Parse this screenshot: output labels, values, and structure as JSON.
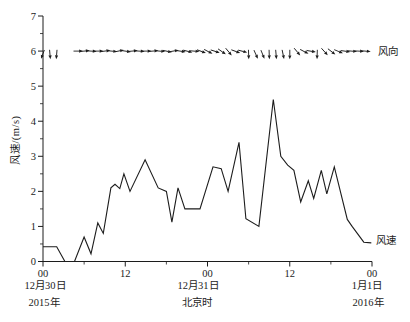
{
  "figure": {
    "width": 410,
    "height": 322,
    "background": "#ffffff",
    "ink_color": "#1c1c1c",
    "labels": {
      "y_axis_title": "风速/(m/s)",
      "x_axis_title": "北京时",
      "series_wind_direction": "风向",
      "series_wind_speed": "风速",
      "date_left_line1": "12月30日",
      "date_left_line2": "2015年",
      "date_mid_line1": "12月31日",
      "date_right_line1": "1月1日",
      "date_right_line2": "2016年"
    }
  },
  "chart_data": {
    "type": "line",
    "title": "",
    "xlabel": "北京时",
    "ylabel": "风速/(m/s)",
    "ylim": [
      0,
      7
    ],
    "xlim_hours": [
      0,
      48
    ],
    "x_axis_span": "2015-12-30 00:00 to 2016-01-01 00:00 Beijing time",
    "grid": false,
    "legend_position": "right-inline",
    "y_major_ticks": [
      0,
      1,
      2,
      3,
      4,
      5,
      6,
      7
    ],
    "y_minor_ticks": [
      0.5,
      1.5,
      2.5,
      3.5,
      4.5,
      5.5,
      6.5
    ],
    "x_major_ticks": [
      {
        "h": 0,
        "label": "00"
      },
      {
        "h": 12,
        "label": "12"
      },
      {
        "h": 24,
        "label": "00"
      },
      {
        "h": 36,
        "label": "12"
      },
      {
        "h": 48,
        "label": "00"
      }
    ],
    "x_minor_ticks_hours": [
      6,
      18,
      30,
      42
    ],
    "series": [
      {
        "name": "风速",
        "type": "line",
        "units": "m/s",
        "points": [
          [
            0,
            0.42
          ],
          [
            2,
            0.42
          ],
          [
            3.2,
            0
          ],
          [
            4.6,
            0
          ],
          [
            6,
            0.7
          ],
          [
            7,
            0.22
          ],
          [
            8,
            1.1
          ],
          [
            8.8,
            0.8
          ],
          [
            9.9,
            2.1
          ],
          [
            10.5,
            2.2
          ],
          [
            11.2,
            2.08
          ],
          [
            11.8,
            2.5
          ],
          [
            12.7,
            2.0
          ],
          [
            14.9,
            2.9
          ],
          [
            16.8,
            2.1
          ],
          [
            18,
            2.0
          ],
          [
            18.8,
            1.12
          ],
          [
            19.7,
            2.1
          ],
          [
            20.7,
            1.5
          ],
          [
            22.9,
            1.5
          ],
          [
            24.8,
            2.7
          ],
          [
            26,
            2.65
          ],
          [
            27,
            2.0
          ],
          [
            28.6,
            3.4
          ],
          [
            29.6,
            1.22
          ],
          [
            31.5,
            1.0
          ],
          [
            33.6,
            4.62
          ],
          [
            34.7,
            3.0
          ],
          [
            35.7,
            2.75
          ],
          [
            36.6,
            2.6
          ],
          [
            37.6,
            1.7
          ],
          [
            38.7,
            2.3
          ],
          [
            39.5,
            1.8
          ],
          [
            40.6,
            2.6
          ],
          [
            41.4,
            1.93
          ],
          [
            42.5,
            2.7
          ],
          [
            44.4,
            1.2
          ],
          [
            45.1,
            1.0
          ],
          [
            46.8,
            0.55
          ],
          [
            47.9,
            0.53
          ]
        ]
      },
      {
        "name": "风向",
        "type": "direction-arrows",
        "baseline_value": 6,
        "angle_convention": "degrees clockwise from east (screen right)",
        "arrows": [
          {
            "h": 0,
            "deg": 110
          },
          {
            "h": 1,
            "deg": 85
          },
          {
            "h": 2,
            "deg": 95
          },
          {
            "h": 5,
            "deg": 0
          },
          {
            "h": 6,
            "deg": -5
          },
          {
            "h": 7,
            "deg": 3
          },
          {
            "h": 8,
            "deg": 0
          },
          {
            "h": 9,
            "deg": -8
          },
          {
            "h": 10,
            "deg": 5
          },
          {
            "h": 11,
            "deg": -12
          },
          {
            "h": 12,
            "deg": 8
          },
          {
            "h": 13,
            "deg": -5
          },
          {
            "h": 14,
            "deg": 3
          },
          {
            "h": 15,
            "deg": 0
          },
          {
            "h": 16,
            "deg": -5
          },
          {
            "h": 17,
            "deg": 5
          },
          {
            "h": 18,
            "deg": 12
          },
          {
            "h": 19,
            "deg": -10
          },
          {
            "h": 20,
            "deg": 8
          },
          {
            "h": 21,
            "deg": 15
          },
          {
            "h": 22,
            "deg": 5
          },
          {
            "h": 23,
            "deg": 20
          },
          {
            "h": 24,
            "deg": 28
          },
          {
            "h": 25,
            "deg": 18
          },
          {
            "h": 26,
            "deg": 35
          },
          {
            "h": 27,
            "deg": 50
          },
          {
            "h": 28,
            "deg": 20
          },
          {
            "h": 29,
            "deg": 15
          },
          {
            "h": 30,
            "deg": 88
          },
          {
            "h": 31,
            "deg": 65
          },
          {
            "h": 32,
            "deg": 68
          },
          {
            "h": 33,
            "deg": 88
          },
          {
            "h": 34,
            "deg": 85
          },
          {
            "h": 35,
            "deg": 78
          },
          {
            "h": 36,
            "deg": 90
          },
          {
            "h": 37,
            "deg": 50
          },
          {
            "h": 38,
            "deg": 28
          },
          {
            "h": 39,
            "deg": 10
          },
          {
            "h": 40,
            "deg": 92
          },
          {
            "h": 41,
            "deg": 48
          },
          {
            "h": 42,
            "deg": 38
          },
          {
            "h": 43,
            "deg": 22
          },
          {
            "h": 44,
            "deg": 8
          },
          {
            "h": 45,
            "deg": 5
          },
          {
            "h": 46,
            "deg": 3
          },
          {
            "h": 47,
            "deg": 5
          }
        ]
      }
    ]
  }
}
